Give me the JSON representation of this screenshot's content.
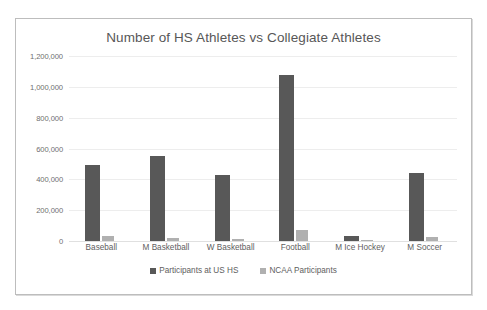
{
  "chart_data": {
    "type": "bar",
    "title": "Number of HS Athletes vs Collegiate Athletes",
    "xlabel": "",
    "ylabel": "",
    "ylim": [
      0,
      1200000
    ],
    "grid": true,
    "legend_position": "bottom",
    "categories": [
      "Baseball",
      "M Basketball",
      "W Basketball",
      "Football",
      "M Ice Hockey",
      "M Soccer"
    ],
    "ytick_labels": [
      "1,200,000",
      "1,000,000",
      "800,000",
      "600,000",
      "400,000",
      "200,000",
      "0"
    ],
    "ytick_values": [
      1200000,
      1000000,
      800000,
      600000,
      400000,
      200000,
      0
    ],
    "series": [
      {
        "name": "Participants at US HS",
        "color": "#585858",
        "values": [
          490000,
          550000,
          430000,
          1080000,
          35000,
          440000
        ]
      },
      {
        "name": "NCAA Participants",
        "color": "#b0b0b0",
        "values": [
          33000,
          18000,
          16000,
          72000,
          4000,
          24000
        ]
      }
    ]
  }
}
